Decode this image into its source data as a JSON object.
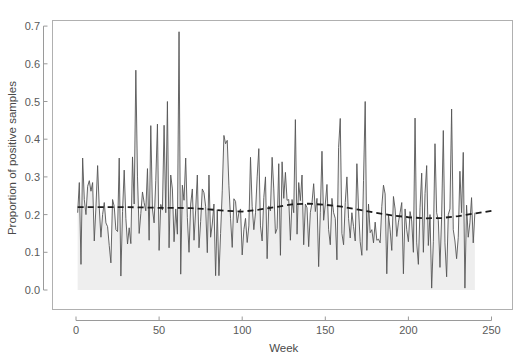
{
  "chart_data": {
    "type": "line",
    "title": "",
    "subtitle": "",
    "xlabel": "Week",
    "ylabel": "Proportion of positive samples",
    "xlim": [
      0,
      252
    ],
    "ylim": [
      -0.02,
      0.72
    ],
    "xticks": [
      0,
      50,
      100,
      150,
      200,
      250
    ],
    "xticklabels": [
      "0",
      "50",
      "100",
      "150",
      "200",
      "250"
    ],
    "yticks": [
      0.0,
      0.1,
      0.2,
      0.3,
      0.4,
      0.5,
      0.6,
      0.7
    ],
    "yticklabels": [
      "0.0",
      "0.1",
      "0.2",
      "0.3",
      "0.4",
      "0.5",
      "0.6",
      "0.7"
    ],
    "grid": false,
    "legend": null,
    "legend_position": "none",
    "box_border": true,
    "series": [
      {
        "name": "Proportion of positive samples",
        "type": "line",
        "style": "solid",
        "color": "#555555",
        "linewidth": 0.9,
        "fill": true,
        "fill_color": "#eeeeee",
        "fill_baseline": 0.0,
        "x_start": 1,
        "x_step": 1,
        "values": [
          0.205,
          0.285,
          0.068,
          0.35,
          0.24,
          0.2,
          0.275,
          0.29,
          0.262,
          0.285,
          0.13,
          0.22,
          0.33,
          0.218,
          0.14,
          0.2,
          0.232,
          0.178,
          0.168,
          0.118,
          0.072,
          0.24,
          0.222,
          0.16,
          0.155,
          0.35,
          0.037,
          0.208,
          0.318,
          0.19,
          0.122,
          0.165,
          0.123,
          0.353,
          0.228,
          0.583,
          0.3,
          0.15,
          0.203,
          0.26,
          0.232,
          0.21,
          0.322,
          0.132,
          0.436,
          0.215,
          0.178,
          0.29,
          0.44,
          0.105,
          0.227,
          0.212,
          0.437,
          0.205,
          0.5,
          0.112,
          0.305,
          0.268,
          0.128,
          0.215,
          0.148,
          0.685,
          0.042,
          0.278,
          0.238,
          0.35,
          0.192,
          0.1,
          0.228,
          0.268,
          0.132,
          0.212,
          0.305,
          0.112,
          0.182,
          0.268,
          0.258,
          0.222,
          0.099,
          0.305,
          0.14,
          0.175,
          0.228,
          0.038,
          0.213,
          0.038,
          0.15,
          0.263,
          0.41,
          0.388,
          0.397,
          0.278,
          0.189,
          0.113,
          0.242,
          0.235,
          0.178,
          0.205,
          0.215,
          0.093,
          0.16,
          0.19,
          0.126,
          0.17,
          0.352,
          0.222,
          0.16,
          0.205,
          0.3,
          0.375,
          0.17,
          0.13,
          0.245,
          0.3,
          0.083,
          0.223,
          0.21,
          0.352,
          0.268,
          0.15,
          0.163,
          0.335,
          0.092,
          0.34,
          0.243,
          0.312,
          0.238,
          0.24,
          0.132,
          0.24,
          0.205,
          0.452,
          0.148,
          0.285,
          0.237,
          0.305,
          0.12,
          0.228,
          0.218,
          0.115,
          0.205,
          0.232,
          0.282,
          0.208,
          0.243,
          0.062,
          0.205,
          0.368,
          0.185,
          0.228,
          0.28,
          0.16,
          0.12,
          0.243,
          0.205,
          0.19,
          0.08,
          0.378,
          0.455,
          0.15,
          0.12,
          0.232,
          0.3,
          0.19,
          0.138,
          0.205,
          0.168,
          0.13,
          0.335,
          0.215,
          0.128,
          0.092,
          0.29,
          0.5,
          0.105,
          0.228,
          0.152,
          0.16,
          0.125,
          0.18,
          0.132,
          0.135,
          0.125,
          0.222,
          0.278,
          0.255,
          0.043,
          0.2,
          0.16,
          0.105,
          0.248,
          0.215,
          0.142,
          0.18,
          0.205,
          0.232,
          0.043,
          0.215,
          0.16,
          0.128,
          0.208,
          0.183,
          0.1,
          0.456,
          0.125,
          0.068,
          0.218,
          0.31,
          0.1,
          0.256,
          0.33,
          0.118,
          0.2,
          0.005,
          0.128,
          0.388,
          0.205,
          0.185,
          0.06,
          0.195,
          0.423,
          0.125,
          0.035,
          0.2,
          0.215,
          0.48,
          0.16,
          0.13,
          0.083,
          0.14,
          0.315,
          0.205,
          0.365,
          0.005,
          0.225,
          0.14,
          0.178,
          0.245,
          0.125,
          0.205
        ]
      },
      {
        "name": "Smoothed trend",
        "type": "line",
        "style": "dashed",
        "color": "#1c1c1c",
        "linewidth": 1.8,
        "fill": false,
        "x": [
          1,
          10,
          20,
          30,
          40,
          50,
          60,
          70,
          80,
          90,
          100,
          110,
          120,
          130,
          140,
          150,
          160,
          170,
          180,
          190,
          200,
          210,
          220,
          230,
          240,
          250
        ],
        "values": [
          0.22,
          0.22,
          0.22,
          0.22,
          0.219,
          0.218,
          0.218,
          0.217,
          0.214,
          0.21,
          0.208,
          0.213,
          0.22,
          0.227,
          0.229,
          0.226,
          0.221,
          0.213,
          0.205,
          0.198,
          0.193,
          0.19,
          0.191,
          0.196,
          0.203,
          0.21
        ]
      }
    ]
  },
  "colors": {
    "plot_background": "#ffffff",
    "figure_background": "#ffffff",
    "axis_line": "#9a9a9a",
    "box_border": "#b0b0b0",
    "tick_label": "#5a5a5a",
    "axis_title": "#4a4a4a",
    "series_line": "#555555",
    "series_fill": "#eeeeee",
    "trend_line": "#1c1c1c"
  },
  "geometry": {
    "width": 527,
    "height": 358,
    "plot_left": 52,
    "plot_right": 513,
    "plot_top": 20,
    "plot_bottom": 310,
    "data_x0": 76,
    "data_x_per_unit": 1.662,
    "data_y0": 290,
    "data_y_per_unit": 377.0
  }
}
